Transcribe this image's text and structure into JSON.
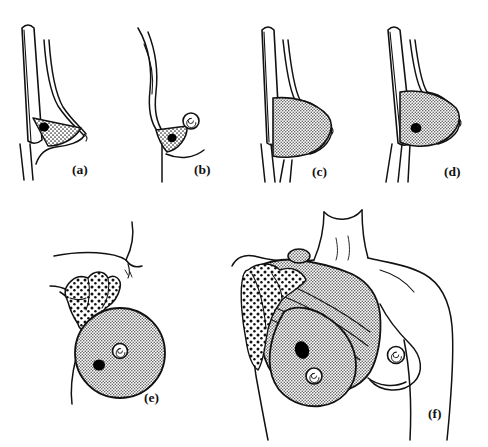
{
  "figure": {
    "background_color": "#ffffff",
    "ink_color": "#111111",
    "panel_count": 6
  },
  "panels": [
    {
      "id": "a",
      "label": "(a)",
      "name": "lumpectomy-wedge-lateral-view",
      "description": "Lateral profile of chest wall and breast with a small stippled wedge of tissue removed around a black tumor",
      "features": [
        "chest-wall",
        "breast-profile",
        "stippled-wedge",
        "black-tumor"
      ],
      "tumor_present": true,
      "nipple_visible": false
    },
    {
      "id": "b",
      "label": "(b)",
      "name": "quadrantectomy-with-nipple-lateral-view",
      "description": "Lateral profile showing a stippled wedge of breast tissue including the region below the nipple",
      "features": [
        "breast-profile",
        "stippled-wedge",
        "black-tumor",
        "nipple-spiral"
      ],
      "tumor_present": true,
      "nipple_visible": true
    },
    {
      "id": "c",
      "label": "(c)",
      "name": "total-mastectomy-lateral-view",
      "description": "Lateral profile with the entire breast mound stippled indicating complete removal",
      "features": [
        "chest-wall",
        "breast-profile",
        "stippled-breast"
      ],
      "tumor_present": false,
      "nipple_visible": false
    },
    {
      "id": "d",
      "label": "(d)",
      "name": "mastectomy-with-tumor-lateral-view",
      "description": "Lateral profile with the entire breast stippled and a black tumor inside it",
      "features": [
        "chest-wall",
        "breast-profile",
        "stippled-breast",
        "black-tumor"
      ],
      "tumor_present": true,
      "nipple_visible": false
    },
    {
      "id": "e",
      "label": "(e)",
      "name": "mastectomy-with-axillary-node-dissection",
      "description": "Oblique view of a round stippled breast with nipple and tumor, joined to a chain of speckled axillary lymph nodes extending into the armpit",
      "features": [
        "shoulder-contour",
        "axillary-node-chain",
        "stippled-breast-circle",
        "nipple-spiral",
        "black-tumor"
      ],
      "tumor_present": true,
      "nipple_visible": true,
      "lymph_nodes": true
    },
    {
      "id": "f",
      "label": "(f)",
      "name": "radical-mastectomy-anterior-view",
      "description": "Anterior view of the female torso: head, neck, shoulders and both breasts. On the patient's right side the breast, underlying striated pectoralis muscle and axillary lymph node chain are shaded to show the full radical resection; the opposite breast is drawn normally with a nipple",
      "features": [
        "neck",
        "shoulders",
        "pectoralis-muscle-striations",
        "shaded-resection-field",
        "axillary-node-chain",
        "stippled-breast",
        "nipple-spiral",
        "black-tumor",
        "normal-contralateral-breast"
      ],
      "tumor_present": true,
      "nipple_visible": true,
      "lymph_nodes": true
    }
  ],
  "legend_keys": {
    "stipple": "Tissue removed at operation",
    "black_dot": "Tumour",
    "speckled_blobs": "Axillary lymph nodes",
    "striations": "Pectoralis muscle fibres"
  }
}
